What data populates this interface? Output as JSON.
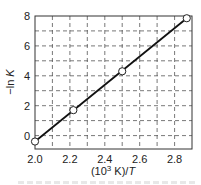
{
  "chart_data": {
    "type": "line",
    "title": "",
    "xlabel": "(10³ K)/T",
    "xlabel_parts": {
      "prefix": "(10",
      "sup": "3",
      "mid": " K)/",
      "italic": "T"
    },
    "ylabel": "−ln K",
    "ylabel_parts": {
      "prefix": "−ln ",
      "italic": "K"
    },
    "xlim": [
      2.0,
      2.9
    ],
    "ylim": [
      -0.9,
      8
    ],
    "x_ticks": [
      2.0,
      2.2,
      2.4,
      2.6,
      2.8
    ],
    "x_tick_labels": [
      "2.0",
      "2.2",
      "2.4",
      "2.6",
      "2.8"
    ],
    "y_ticks": [
      0,
      2,
      4,
      6,
      8
    ],
    "y_tick_labels": [
      "0",
      "2",
      "4",
      "6",
      "8"
    ],
    "grid": {
      "on": true,
      "style": "dashed",
      "x_step": 0.1,
      "y_step": 1
    },
    "legend": null,
    "series": [
      {
        "name": "data",
        "marker": "open-circle",
        "x": [
          2.0,
          2.22,
          2.5,
          2.87
        ],
        "y": [
          -0.4,
          1.7,
          4.3,
          7.85
        ]
      },
      {
        "name": "linear fit",
        "marker": "none",
        "x": [
          2.0,
          2.87
        ],
        "y": [
          -0.4,
          7.85
        ]
      }
    ],
    "colors": {
      "line": "#111111",
      "grid": "#555555",
      "frame": "#333333",
      "marker_fill": "#ffffff"
    }
  }
}
